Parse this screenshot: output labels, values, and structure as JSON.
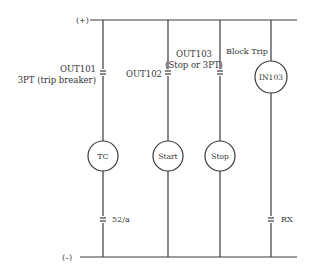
{
  "diagram": {
    "rails": {
      "positive_label": "(+)",
      "negative_label": "(–)"
    },
    "branches": [
      {
        "contact_label_lines": [
          "OUT101",
          "3PT (trip breaker)"
        ],
        "coil_label": "TC",
        "lower_contact_label": "52/a"
      },
      {
        "contact_label_lines": [
          "OUT102"
        ],
        "coil_label": "Start"
      },
      {
        "contact_label_lines": [
          "OUT103",
          "(Stop or 3PT)"
        ],
        "coil_label": "Stop"
      },
      {
        "upper_label": "Block Trip",
        "input_label": "IN103",
        "lower_contact_label": "RX"
      }
    ],
    "colors": {
      "line": "#3a3a3a",
      "text": "#333333",
      "background": "#ffffff"
    }
  }
}
